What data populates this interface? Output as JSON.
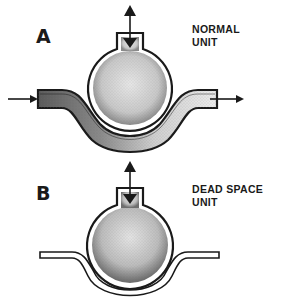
{
  "panels": [
    {
      "letter": "A",
      "title_line1": "NORMAL",
      "title_line2": "UNIT",
      "ventilation": "bidirectional",
      "perfusion": "present",
      "blood_flow_arrows": [
        "in-left",
        "out-right"
      ]
    },
    {
      "letter": "B",
      "title_line1": "DEAD SPACE",
      "title_line2": "UNIT",
      "ventilation": "bidirectional",
      "perfusion": "absent"
    }
  ],
  "colors": {
    "ink": "#1a1a1a",
    "stipple": "#6b6b6b",
    "background": "#ffffff"
  }
}
